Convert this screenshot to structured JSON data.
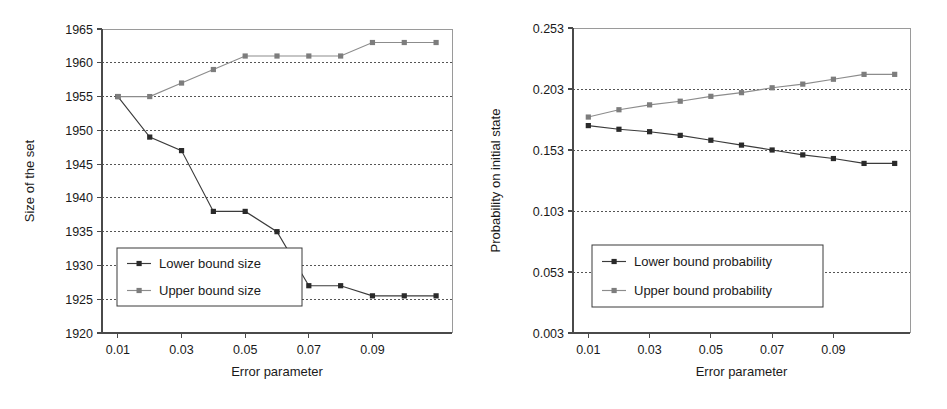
{
  "figure": {
    "background": "#ffffff",
    "panel_count": 2
  },
  "chart_data": [
    {
      "id": "set-size-chart",
      "type": "line",
      "title": "",
      "xlabel": "Error parameter",
      "ylabel": "Size of the set",
      "x": [
        0.01,
        0.02,
        0.03,
        0.04,
        0.05,
        0.06,
        0.07,
        0.08,
        0.09,
        0.1,
        0.11
      ],
      "xlim": [
        0.005,
        0.115
      ],
      "ylim": [
        1920,
        1965
      ],
      "xticks": [
        0.01,
        0.03,
        0.05,
        0.07,
        0.09
      ],
      "xtick_labels": [
        "0.01",
        "0.03",
        "0.05",
        "0.07",
        "0.09"
      ],
      "yticks": [
        1920,
        1925,
        1930,
        1935,
        1940,
        1945,
        1950,
        1955,
        1960,
        1965
      ],
      "ytick_labels": [
        "1920",
        "1925",
        "1930",
        "1935",
        "1940",
        "1945",
        "1950",
        "1955",
        "1960",
        "1965"
      ],
      "grid": true,
      "grid_axis": "y",
      "legend_position": "lower-left",
      "series": [
        {
          "name": "Lower bound size",
          "color": "#2a2a2a",
          "marker": "square",
          "values": [
            1955,
            1949,
            1947,
            1938,
            1938,
            1935,
            1927,
            1927,
            1925.5,
            1925.5,
            1925.5
          ]
        },
        {
          "name": "Upper bound size",
          "color": "#7d7d7d",
          "marker": "square",
          "values": [
            1955,
            1955,
            1957,
            1959,
            1961,
            1961,
            1961,
            1961,
            1963,
            1963,
            1963
          ]
        }
      ]
    },
    {
      "id": "initial-state-probability-chart",
      "type": "line",
      "title": "",
      "xlabel": "Error parameter",
      "ylabel": "Probability on initial state",
      "x": [
        0.01,
        0.02,
        0.03,
        0.04,
        0.05,
        0.06,
        0.07,
        0.08,
        0.09,
        0.1,
        0.11
      ],
      "xlim": [
        0.005,
        0.115
      ],
      "ylim": [
        0.003,
        0.253
      ],
      "xticks": [
        0.01,
        0.03,
        0.05,
        0.07,
        0.09
      ],
      "xtick_labels": [
        "0.01",
        "0.03",
        "0.05",
        "0.07",
        "0.09"
      ],
      "yticks": [
        0.003,
        0.053,
        0.103,
        0.153,
        0.203,
        0.253
      ],
      "ytick_labels": [
        "0.003",
        "0.053",
        "0.103",
        "0.153",
        "0.203",
        "0.253"
      ],
      "grid": true,
      "grid_axis": "y",
      "legend_position": "lower-left",
      "series": [
        {
          "name": "Lower bound probability",
          "color": "#2a2a2a",
          "marker": "square",
          "values": [
            0.173,
            0.17,
            0.168,
            0.165,
            0.161,
            0.157,
            0.153,
            0.149,
            0.146,
            0.142,
            0.142
          ]
        },
        {
          "name": "Upper bound probability",
          "color": "#7d7d7d",
          "marker": "square",
          "values": [
            0.18,
            0.186,
            0.19,
            0.193,
            0.197,
            0.2,
            0.204,
            0.207,
            0.211,
            0.215,
            0.215
          ]
        }
      ]
    }
  ]
}
